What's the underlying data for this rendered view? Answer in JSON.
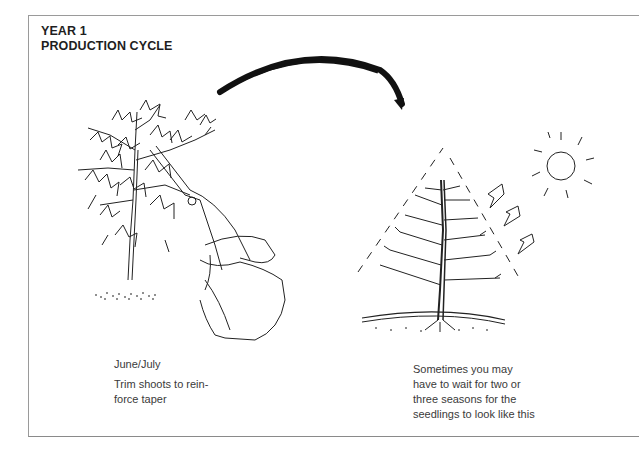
{
  "title": {
    "line1": "YEAR 1",
    "line2": "PRODUCTION CYCLE"
  },
  "left_panel": {
    "illustration": "hand-with-pruning-shears-trimming-seedling",
    "date": "June/July",
    "caption_line1": "Trim shoots to rein-",
    "caption_line2": "force taper"
  },
  "right_panel": {
    "illustration": "pruned-tapered-tree-with-sun-and-light-arrows",
    "caption_line1": "Sometimes you may",
    "caption_line2": "have to wait for two or",
    "caption_line3": "three seasons for the",
    "caption_line4": "seedlings to look like this"
  },
  "connector": "curved-arrow-left-to-right",
  "colors": {
    "ink": "#1a1a1a",
    "text": "#3a3a3a",
    "border": "#9a9a9a",
    "background": "#ffffff"
  }
}
